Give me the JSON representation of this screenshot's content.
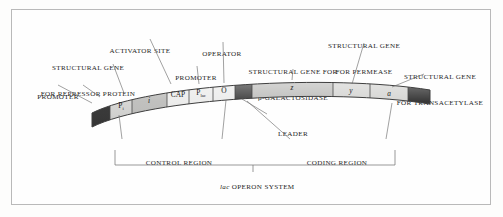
{
  "figure": {
    "title_caption": "lac OPERON SYSTEM",
    "caption_italic_part": "lac",
    "caption_rest": " OPERON SYSTEM"
  },
  "labels_top": [
    {
      "id": "structural-gene-repressor",
      "line1": "STRUCTURAL GENE",
      "line2": "FOR REPRESSOR PROTEIN"
    },
    {
      "id": "activator-site",
      "line1": "ACTIVATOR SITE",
      "line2": ""
    },
    {
      "id": "promoter-left",
      "line1": "PROMOTER",
      "line2": ""
    },
    {
      "id": "promoter-lac",
      "line1": "PROMOTER",
      "line2": ""
    },
    {
      "id": "operator",
      "line1": "OPERATOR",
      "line2": ""
    },
    {
      "id": "structural-gene-beta-galactosidase",
      "line1": "STRUCTURAL GENE FOR",
      "line2": "β-GALACTOSIDASE"
    },
    {
      "id": "structural-gene-permease",
      "line1": "STRUCTURAL GENE",
      "line2": "FOR PERMEASE"
    },
    {
      "id": "structural-gene-transacetylase",
      "line1": "STRUCTURAL GENE",
      "line2": "FOR TRANSACETYLASE"
    }
  ],
  "labels_bottom": [
    {
      "id": "leader",
      "text": "LEADER"
    },
    {
      "id": "control-region",
      "text": "CONTROL REGION"
    },
    {
      "id": "coding-region",
      "text": "CODING REGION"
    }
  ],
  "strand_segments": [
    {
      "id": "cap-left",
      "label": "",
      "fill": "#2e2e2e",
      "style": "dark-cap"
    },
    {
      "id": "segment-p-i",
      "label": "P",
      "sub": "i",
      "fill": "#d4d4d2",
      "style": "light"
    },
    {
      "id": "segment-i",
      "label": "i",
      "sub": "",
      "fill": "#bdbdbb",
      "style": "mid"
    },
    {
      "id": "segment-cap",
      "label": "CAP",
      "sub": "",
      "fill": "#ececeb",
      "style": "pale"
    },
    {
      "id": "segment-p-lac",
      "label": "P",
      "sub": "lac",
      "fill": "#ececeb",
      "style": "pale"
    },
    {
      "id": "segment-o",
      "label": "O",
      "sub": "",
      "fill": "#ececeb",
      "style": "pale"
    },
    {
      "id": "segment-leader",
      "label": "",
      "sub": "",
      "fill": "#3a3a3a",
      "style": "dark"
    },
    {
      "id": "segment-z",
      "label": "z",
      "sub": "",
      "fill": "#bdbdbb",
      "style": "mid"
    },
    {
      "id": "segment-y",
      "label": "y",
      "sub": "",
      "fill": "#d4d4d2",
      "style": "light"
    },
    {
      "id": "segment-a",
      "label": "a",
      "sub": "",
      "fill": "#d4d4d2",
      "style": "light"
    },
    {
      "id": "cap-right",
      "label": "",
      "sub": "",
      "fill": "#2e2e2e",
      "style": "dark-cap"
    }
  ],
  "colors": {
    "frame_border": "#b9b9b9",
    "background": "#fefefe",
    "stroke": "#3f3f3f",
    "leader_line": "#6e6e6e",
    "text": "#262626"
  }
}
